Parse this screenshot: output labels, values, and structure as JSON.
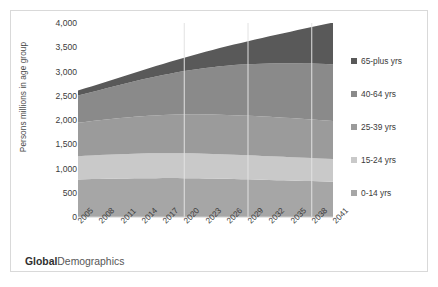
{
  "brand": {
    "bold": "Global",
    "light": "Demographics"
  },
  "chart_data": {
    "type": "area",
    "stacked": true,
    "title": "",
    "xlabel": "",
    "ylabel": "Persons millions in age group",
    "ylim": [
      0,
      4000
    ],
    "ytick_labels": [
      "4,000",
      "3,500",
      "3,000",
      "2,500",
      "2,000",
      "1,500",
      "1,000",
      "500",
      "0"
    ],
    "ytick_values": [
      4000,
      3500,
      3000,
      2500,
      2000,
      1500,
      1000,
      500,
      0
    ],
    "grid": "vertical-only",
    "gridline_years": [
      2020,
      2029,
      2038
    ],
    "legend_position": "right",
    "categories": [
      2005,
      2006,
      2007,
      2008,
      2009,
      2010,
      2011,
      2012,
      2013,
      2014,
      2015,
      2016,
      2017,
      2018,
      2019,
      2020,
      2021,
      2022,
      2023,
      2024,
      2025,
      2026,
      2027,
      2028,
      2029,
      2030,
      2031,
      2032,
      2033,
      2034,
      2035,
      2036,
      2037,
      2038,
      2039,
      2040,
      2041
    ],
    "xtick_labels": [
      "2005",
      "2008",
      "2011",
      "2014",
      "2017",
      "2020",
      "2023",
      "2026",
      "2029",
      "2032",
      "2035",
      "2038",
      "2041"
    ],
    "series": [
      {
        "name": "0-14 yrs",
        "color": "#a6a6a6",
        "values": [
          775,
          778,
          781,
          784,
          787,
          790,
          793,
          795,
          797,
          799,
          800,
          801,
          802,
          802,
          802,
          801,
          800,
          798,
          796,
          793,
          790,
          787,
          784,
          780,
          776,
          772,
          768,
          764,
          760,
          756,
          752,
          748,
          744,
          740,
          736,
          732,
          728
        ]
      },
      {
        "name": "15-24 yrs",
        "color": "#c9c9c9",
        "values": [
          480,
          484,
          488,
          492,
          496,
          500,
          503,
          506,
          509,
          511,
          513,
          514,
          515,
          515,
          515,
          514,
          513,
          512,
          510,
          508,
          506,
          504,
          501,
          499,
          496,
          494,
          491,
          489,
          486,
          484,
          481,
          479,
          476,
          474,
          471,
          469,
          466
        ]
      },
      {
        "name": "25-39 yrs",
        "color": "#9b9b9b",
        "values": [
          690,
          699,
          708,
          717,
          726,
          735,
          743,
          751,
          759,
          766,
          773,
          779,
          785,
          790,
          795,
          799,
          803,
          806,
          809,
          811,
          813,
          814,
          815,
          815,
          815,
          814,
          813,
          812,
          810,
          808,
          806,
          803,
          800,
          797,
          794,
          790,
          786
        ]
      },
      {
        "name": "40-64 yrs",
        "color": "#8a8a8a",
        "values": [
          560,
          580,
          601,
          622,
          644,
          666,
          688,
          711,
          734,
          757,
          780,
          803,
          826,
          849,
          872,
          894,
          916,
          937,
          958,
          978,
          997,
          1015,
          1032,
          1048,
          1063,
          1077,
          1090,
          1102,
          1113,
          1123,
          1132,
          1140,
          1147,
          1153,
          1158,
          1162,
          1165
        ]
      },
      {
        "name": "65-plus yrs",
        "color": "#595959",
        "values": [
          105,
          112,
          120,
          128,
          137,
          146,
          156,
          166,
          177,
          189,
          201,
          214,
          228,
          243,
          259,
          276,
          294,
          313,
          333,
          354,
          376,
          399,
          423,
          448,
          474,
          501,
          529,
          558,
          588,
          619,
          651,
          684,
          718,
          753,
          789,
          826,
          864
        ]
      }
    ],
    "totals_note": "stacked totals rise from ~2,610 in 2005 to ~3,651 in 2041",
    "legend_order_top_to_bottom": [
      "65-plus yrs",
      "40-64 yrs",
      "25-39 yrs",
      "15-24 yrs",
      "0-14 yrs"
    ]
  }
}
